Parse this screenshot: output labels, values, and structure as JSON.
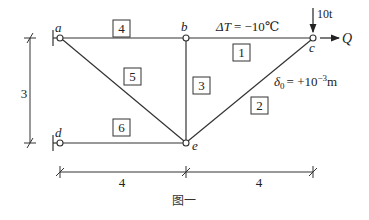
{
  "figure": {
    "caption": "图一",
    "colors": {
      "line": "#333333",
      "text": "#222222",
      "background": "#ffffff"
    }
  },
  "nodes": [
    {
      "id": "a",
      "label": "a",
      "x": 60,
      "y": 38
    },
    {
      "id": "b",
      "label": "b",
      "x": 186,
      "y": 38
    },
    {
      "id": "c",
      "label": "c",
      "x": 313,
      "y": 38
    },
    {
      "id": "d",
      "label": "d",
      "x": 60,
      "y": 143
    },
    {
      "id": "e",
      "label": "e",
      "x": 186,
      "y": 143
    }
  ],
  "members": [
    {
      "id": "1",
      "label": "1",
      "from": "b",
      "to": "c"
    },
    {
      "id": "2",
      "label": "2",
      "from": "e",
      "to": "c"
    },
    {
      "id": "3",
      "label": "3",
      "from": "b",
      "to": "e"
    },
    {
      "id": "4",
      "label": "4",
      "from": "a",
      "to": "b"
    },
    {
      "id": "5",
      "label": "5",
      "from": "a",
      "to": "e"
    },
    {
      "id": "6",
      "label": "6",
      "from": "d",
      "to": "e"
    }
  ],
  "annotations": {
    "temperature": "ΔT = −10℃",
    "temp_prefix": "ΔT",
    "temp_value": "= −10℃",
    "settlement_symbol": "δ",
    "settlement_sub": "0",
    "settlement_value": "= +10",
    "settlement_exp": "−3",
    "settlement_unit": "m",
    "load_vertical": "10t",
    "load_horizontal": "Q"
  },
  "dimensions": {
    "height": "3",
    "width_left": "4",
    "width_right": "4"
  }
}
